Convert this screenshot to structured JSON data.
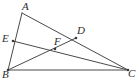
{
  "figure": {
    "kind": "geometry-diagram",
    "background_color": "#ffffff",
    "stroke_color": "#4a4a4a",
    "label_color": "#2e2e2e",
    "width": 137,
    "height": 82
  },
  "points": [
    {
      "id": "A",
      "label": "A",
      "x": 22,
      "y": 13,
      "label_x": 22,
      "label_y": 1,
      "dot": false
    },
    {
      "id": "B",
      "label": "B",
      "x": 8,
      "y": 70,
      "label_x": 2,
      "label_y": 69,
      "dot": true
    },
    {
      "id": "C",
      "label": "C",
      "x": 128,
      "y": 70,
      "label_x": 128,
      "label_y": 68,
      "dot": true
    },
    {
      "id": "D",
      "label": "D",
      "x": 76,
      "y": 38,
      "label_x": 77,
      "label_y": 25,
      "dot": true
    },
    {
      "id": "E",
      "label": "E",
      "x": 13,
      "y": 41,
      "label_x": 2,
      "label_y": 33,
      "dot": true
    },
    {
      "id": "F",
      "label": "F",
      "x": 55,
      "y": 49,
      "label_x": 54,
      "label_y": 36,
      "dot": true
    }
  ],
  "segments": [
    {
      "id": "AB",
      "from": "A",
      "to": "B",
      "name": "side-ab"
    },
    {
      "id": "AC",
      "from": "A",
      "to": "C",
      "name": "side-ac"
    },
    {
      "id": "BC",
      "from": "B",
      "to": "C",
      "name": "side-bc"
    },
    {
      "id": "BD",
      "from": "B",
      "to": "D",
      "name": "cevian-bd"
    },
    {
      "id": "EC",
      "from": "E",
      "to": "C",
      "name": "cevian-ec"
    }
  ]
}
